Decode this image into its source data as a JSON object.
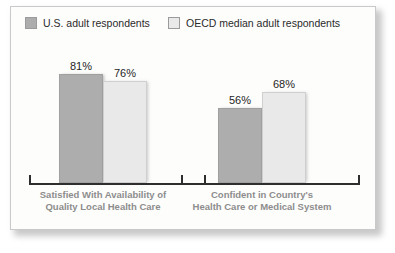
{
  "chart_data": {
    "type": "bar",
    "title": "",
    "xlabel": "",
    "ylabel": "",
    "ylim": [
      0,
      100
    ],
    "grid": false,
    "legend_position": "top",
    "value_suffix": "%",
    "categories": [
      "Satisfied With Availability of Quality Local Health Care",
      "Confident in Country's Health Care or Medical System"
    ],
    "category_lines": [
      [
        "Satisfied With Availability of",
        "Quality Local Health Care"
      ],
      [
        "Confident in Country's",
        "Health Care or Medical System"
      ]
    ],
    "series": [
      {
        "name": "U.S. adult respondents",
        "color": "#adadad",
        "values": [
          81,
          76
        ]
      },
      {
        "name": "OECD median adult respondents",
        "color": "#e9e9e9",
        "values": [
          76,
          68
        ]
      }
    ],
    "bars": [
      {
        "group": 0,
        "series": 0,
        "value": 81,
        "label": "81%",
        "style": "dark",
        "left": 48,
        "height": 109
      },
      {
        "group": 0,
        "series": 1,
        "value": 76,
        "label": "76%",
        "style": "light",
        "left": 92,
        "height": 102
      },
      {
        "group": 1,
        "series": 0,
        "value": 56,
        "label": "56%",
        "style": "dark",
        "left": 207,
        "height": 75
      },
      {
        "group": 1,
        "series": 1,
        "value": 68,
        "label": "68%",
        "style": "light",
        "left": 251,
        "height": 91
      }
    ],
    "axis_ticks_x": [
      18,
      170,
      193,
      347
    ]
  },
  "legend": {
    "items": [
      {
        "label": "U.S. adult respondents",
        "swatch": "dark"
      },
      {
        "label": "OECD median adult respondents",
        "swatch": "light"
      }
    ]
  }
}
